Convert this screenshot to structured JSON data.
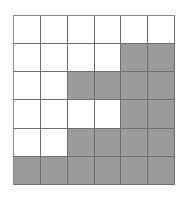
{
  "top_caption": "",
  "bottom_caption": "",
  "grid": {
    "rows": 6,
    "cols": 6,
    "fill_color": "#9b9b9b",
    "empty_color": "#ffffff",
    "line_color": "#6f6f6f",
    "shaded": [
      [
        0,
        0,
        0,
        0,
        0,
        0
      ],
      [
        0,
        0,
        0,
        0,
        1,
        1
      ],
      [
        0,
        0,
        1,
        1,
        1,
        1
      ],
      [
        0,
        0,
        0,
        0,
        1,
        1
      ],
      [
        0,
        0,
        1,
        1,
        1,
        1
      ],
      [
        1,
        1,
        1,
        1,
        1,
        1
      ]
    ]
  }
}
